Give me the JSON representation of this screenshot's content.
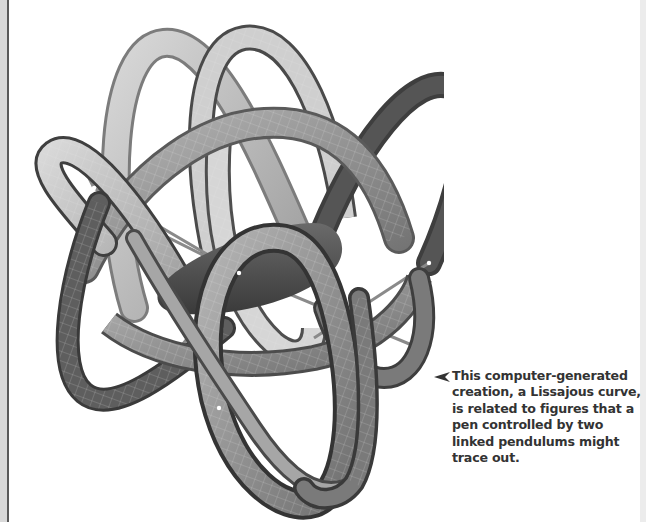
{
  "figure": {
    "icon": "lissajous-figure-illustration",
    "palette": {
      "light": "#c9c9c9",
      "mid": "#9a9a9a",
      "dark": "#5e5e5e",
      "darkest": "#3c3c3c",
      "gridline": "#e6e6e6"
    }
  },
  "caption": {
    "arrow_icon": "left-pointer-arrow-icon",
    "lines": [
      "This computer-generated",
      "creation, a Lissajous curve,",
      "is related to figures that a",
      "pen controlled by two",
      "linked pendulums might",
      "trace out."
    ],
    "color": "#333333"
  }
}
